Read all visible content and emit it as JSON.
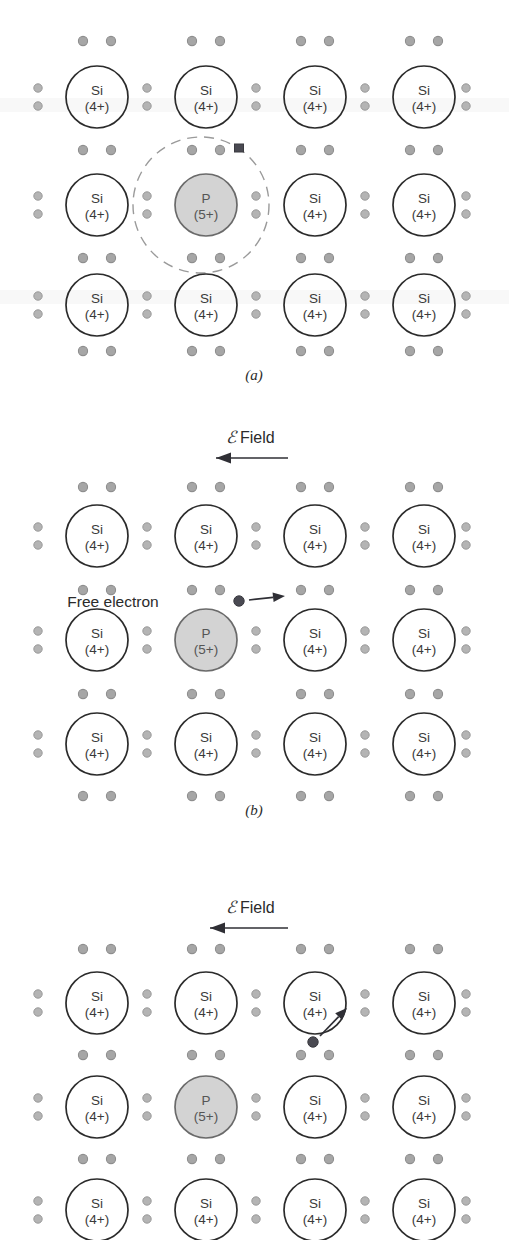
{
  "figure": {
    "background": "#ffffff",
    "ink": "#2b2b2b",
    "dot_color": "#a6a6a6",
    "p_fill": "#d3d3d3",
    "electron_color": "#4a4a52"
  },
  "labels": {
    "si_top": "Si",
    "si_bottom": "(4+)",
    "p_top": "P",
    "p_bottom": "(5+)",
    "field_symbol": "ℰ",
    "field_word": "Field",
    "free_electron": "Free electron"
  },
  "panels": [
    {
      "id": "a",
      "caption": "(a)",
      "caption_x": 254,
      "caption_y": 377,
      "top": 0,
      "height": 400,
      "has_field_arrow": false,
      "has_orbit": true,
      "has_free_electron_label": false,
      "orbit": {
        "cx": 201,
        "cy": 205,
        "r": 68
      },
      "bound_electron": {
        "cx": 239,
        "cy": 148,
        "r": 4.6
      },
      "atom_cols_x": [
        97,
        206,
        315,
        424
      ],
      "atom_rows_y": [
        97,
        205,
        305
      ],
      "p_position": {
        "col": 1,
        "row": 1
      },
      "dot_rows_y": [
        41,
        150,
        258,
        351
      ],
      "side_dot_cols_x": [
        38,
        147,
        256,
        365,
        466
      ]
    },
    {
      "id": "b",
      "caption": "(b)",
      "caption_x": 254,
      "caption_y": 812,
      "top": 400,
      "height": 420,
      "has_field_arrow": true,
      "has_orbit": false,
      "has_free_electron_label": true,
      "field_label": {
        "x": 226,
        "y": 43,
        "arrow_x1": 288,
        "arrow_x2": 216,
        "arrow_y": 58
      },
      "free_label": {
        "x": 113,
        "y": 207
      },
      "free_electron": {
        "cx": 239,
        "cy": 201,
        "r": 5.2
      },
      "free_arrow": {
        "x1": 249,
        "y1": 200,
        "x2": 285,
        "y2": 196
      },
      "atom_cols_x": [
        97,
        206,
        315,
        424
      ],
      "atom_rows_y": [
        136,
        240,
        344
      ],
      "p_position": {
        "col": 1,
        "row": 1
      },
      "dot_rows_y": [
        87,
        190,
        294,
        396
      ],
      "side_dot_cols_x": [
        38,
        147,
        256,
        365,
        466
      ]
    },
    {
      "id": "c",
      "caption": "",
      "caption_x": 254,
      "caption_y": 0,
      "top": 820,
      "height": 420,
      "has_field_arrow": true,
      "has_orbit": false,
      "has_free_electron_label": false,
      "field_label": {
        "x": 226,
        "y": 93,
        "arrow_x1": 288,
        "arrow_x2": 210,
        "arrow_y": 108
      },
      "free_electron": {
        "cx": 313,
        "cy": 222,
        "r": 5.2
      },
      "free_arrow": {
        "x1": 320,
        "y1": 216,
        "x2": 347,
        "y2": 188
      },
      "atom_cols_x": [
        97,
        206,
        315,
        424
      ],
      "atom_rows_y": [
        183,
        287,
        390
      ],
      "p_position": {
        "col": 1,
        "row": 1
      },
      "dot_rows_y": [
        129,
        235,
        339
      ],
      "side_dot_cols_x": [
        38,
        147,
        256,
        365,
        466
      ]
    }
  ]
}
